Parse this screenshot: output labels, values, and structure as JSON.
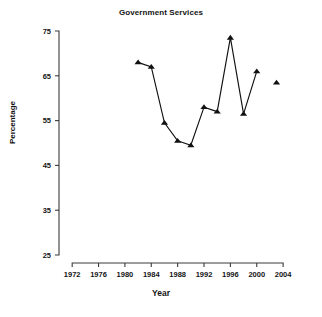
{
  "chart_data": {
    "type": "line",
    "title": "Government Services",
    "xlabel": "Year",
    "ylabel": "Percentage",
    "xlim": [
      1970,
      2005.5
    ],
    "ylim": [
      25,
      75
    ],
    "xticks": [
      1972,
      1976,
      1980,
      1984,
      1988,
      1992,
      1996,
      2000,
      2004
    ],
    "xtick_labels": [
      "1972",
      "1976",
      "1980",
      "1984",
      "1988",
      "1992",
      "1996",
      "2000",
      "2004"
    ],
    "yticks": [
      25,
      35,
      45,
      55,
      65,
      75
    ],
    "ytick_labels": [
      "25",
      "35",
      "45",
      "55",
      "65",
      "75"
    ],
    "grid": false,
    "legend": null,
    "marker": "triangle-up",
    "marker_color": "#111111",
    "line_color": "#111111",
    "series": [
      {
        "name": "Government Services",
        "connected": true,
        "x": [
          1982,
          1984,
          1986,
          1988,
          1990,
          1992,
          1994,
          1996,
          1998,
          2000
        ],
        "values": [
          68.0,
          67.0,
          54.5,
          50.5,
          49.5,
          58.0,
          57.0,
          73.5,
          56.5,
          66.0
        ]
      },
      {
        "name": "Government Services (isolated point)",
        "connected": false,
        "x": [
          2003
        ],
        "values": [
          63.5
        ]
      }
    ]
  },
  "axis_titles": {
    "x": "Year",
    "y": "Percentage"
  },
  "title": "Government Services"
}
